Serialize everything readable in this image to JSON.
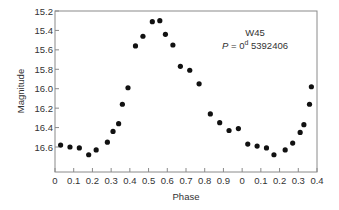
{
  "chart_data": {
    "type": "scatter",
    "title": "",
    "xlabel": "Phase",
    "ylabel": "Magnitude",
    "xlim": [
      0,
      1.4
    ],
    "ylim": [
      15.2,
      16.75
    ],
    "y_inverted": true,
    "grid": false,
    "legend": null,
    "x_tick_labels": [
      "0",
      "0.1",
      "0.2",
      "0.3",
      "0.4",
      "0.5",
      "0.6",
      "0.7",
      "0.8",
      "0.9",
      "0",
      "0.1",
      "0.2",
      "0.3",
      "0.4"
    ],
    "y_tick_labels": [
      "15.2",
      "15.4",
      "15.6",
      "15.8",
      "16.0",
      "16.2",
      "16.4",
      "16.6"
    ],
    "y_tick_values": [
      15.2,
      15.4,
      15.6,
      15.8,
      16.0,
      16.2,
      16.4,
      16.6
    ],
    "annotations": [
      {
        "text": "W45",
        "role": "star-name"
      },
      {
        "text": "P = 0d 5392406",
        "role": "period",
        "italic_prefix": "P",
        "value": "0",
        "superscript": "d",
        "rest": "5392406"
      }
    ],
    "series": [
      {
        "name": "W45",
        "marker": "filled-circle",
        "color": "#111111",
        "points": [
          {
            "x": 0.03,
            "y": 16.58
          },
          {
            "x": 0.08,
            "y": 16.6
          },
          {
            "x": 0.13,
            "y": 16.61
          },
          {
            "x": 0.18,
            "y": 16.68
          },
          {
            "x": 0.22,
            "y": 16.63
          },
          {
            "x": 0.28,
            "y": 16.55
          },
          {
            "x": 0.31,
            "y": 16.44
          },
          {
            "x": 0.34,
            "y": 16.36
          },
          {
            "x": 0.36,
            "y": 16.16
          },
          {
            "x": 0.39,
            "y": 15.99
          },
          {
            "x": 0.43,
            "y": 15.56
          },
          {
            "x": 0.47,
            "y": 15.46
          },
          {
            "x": 0.52,
            "y": 15.31
          },
          {
            "x": 0.56,
            "y": 15.3
          },
          {
            "x": 0.59,
            "y": 15.44
          },
          {
            "x": 0.63,
            "y": 15.55
          },
          {
            "x": 0.67,
            "y": 15.77
          },
          {
            "x": 0.72,
            "y": 15.81
          },
          {
            "x": 0.77,
            "y": 15.95
          },
          {
            "x": 0.83,
            "y": 16.26
          },
          {
            "x": 0.88,
            "y": 16.35
          },
          {
            "x": 0.93,
            "y": 16.43
          },
          {
            "x": 0.98,
            "y": 16.41
          },
          {
            "x": 1.03,
            "y": 16.57
          },
          {
            "x": 1.08,
            "y": 16.59
          },
          {
            "x": 1.13,
            "y": 16.61
          },
          {
            "x": 1.17,
            "y": 16.68
          },
          {
            "x": 1.23,
            "y": 16.63
          },
          {
            "x": 1.27,
            "y": 16.56
          },
          {
            "x": 1.31,
            "y": 16.45
          },
          {
            "x": 1.33,
            "y": 16.37
          },
          {
            "x": 1.36,
            "y": 16.16
          },
          {
            "x": 1.37,
            "y": 15.98
          }
        ]
      }
    ]
  },
  "labels": {
    "star_name": "W45",
    "period_symbol": "P",
    "period_eq": " = 0",
    "period_sup": "d",
    "period_rest": " 5392406",
    "xlabel": "Phase",
    "ylabel": "Magnitude"
  }
}
